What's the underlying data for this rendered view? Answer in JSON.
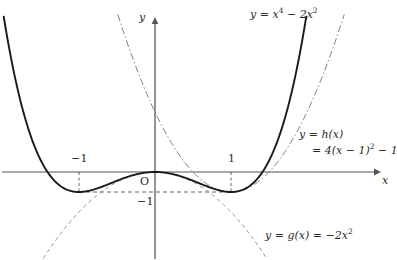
{
  "figure": {
    "title": "",
    "background_color": "#ffffff",
    "axis_color": "#555555",
    "curve_color": "#1a1a1a",
    "helper_color": "#6b6b6b",
    "text_color": "#2b2b2b"
  },
  "axes": {
    "x_axis_label": "x",
    "y_axis_label": "y",
    "origin_label": "O",
    "x_ticks": [
      {
        "value": -1,
        "label": "−1"
      },
      {
        "value": 1,
        "label": "1"
      }
    ],
    "y_ticks": [
      {
        "value": -1,
        "label": "−1"
      }
    ],
    "xlim": [
      -2.0,
      2.95
    ],
    "ylim": [
      -4.4,
      7.6
    ],
    "grid": false
  },
  "curves": [
    {
      "id": "quartic",
      "name": "f",
      "label_text": "y = x",
      "label_exp1": "4",
      "label_mid": " − 2x",
      "label_exp2": "2",
      "expression": "y = x^4 - 2x^2",
      "style": "solid",
      "color": "#1a1a1a",
      "width": 1.9,
      "minima": [
        {
          "x": -1,
          "y": -1
        },
        {
          "x": 1,
          "y": -1
        }
      ],
      "roots": [
        -1.41421,
        0,
        1.41421
      ]
    },
    {
      "id": "h",
      "name": "h",
      "label_line1": "y = h(x)",
      "label_line2_pre": "= 4(x − 1)",
      "label_line2_exp": "2",
      "label_line2_post": " − 1",
      "expression": "y = h(x) = 4(x-1)^2 - 1",
      "style": "dashdot",
      "color": "#7a7a7a",
      "width": 1.0,
      "vertex": {
        "x": 1,
        "y": -1
      },
      "y_intercept": 3
    },
    {
      "id": "g",
      "name": "g",
      "label_pre": "y = g(x) = −2x",
      "label_exp": "2",
      "expression": "y = g(x) = -2x^2",
      "style": "dashed",
      "color": "#8a8a8a",
      "width": 1.0,
      "vertex": {
        "x": 0,
        "y": 0
      }
    }
  ],
  "guides": [
    {
      "id": "hline-minus1",
      "type": "horizontal-dashed",
      "y": -1,
      "from_x": -1,
      "to_x": 1
    },
    {
      "id": "vline-left-min",
      "type": "vertical-dashed",
      "x": -1,
      "from_y": 0,
      "to_y": -1
    },
    {
      "id": "vline-right-min",
      "type": "vertical-dashed",
      "x": 1,
      "from_y": 0,
      "to_y": -1
    }
  ],
  "chart_data": {
    "type": "line",
    "title": "",
    "xlabel": "x",
    "ylabel": "y",
    "xlim": [
      -2.0,
      2.95
    ],
    "ylim": [
      -4.4,
      7.6
    ],
    "grid": false,
    "legend": "inline-annotations",
    "annotations": [
      {
        "text": "y = x⁴ − 2x²",
        "x": 1.55,
        "y": 7.2
      },
      {
        "text": "y = h(x) = 4(x − 1)² − 1",
        "x": 2.0,
        "y": 1.6
      },
      {
        "text": "y = g(x) = −2x²",
        "x": 1.65,
        "y": -3.3
      }
    ],
    "series": [
      {
        "name": "y = x^4 - 2x^2",
        "style": "solid",
        "x": [
          -1.8,
          -1.7,
          -1.6,
          -1.5,
          -1.4,
          -1.3,
          -1.2,
          -1.1,
          -1.0,
          -0.9,
          -0.8,
          -0.7,
          -0.6,
          -0.5,
          -0.4,
          -0.3,
          -0.2,
          -0.1,
          0.0,
          0.1,
          0.2,
          0.3,
          0.4,
          0.5,
          0.6,
          0.7,
          0.8,
          0.9,
          1.0,
          1.1,
          1.2,
          1.3,
          1.4,
          1.5,
          1.6,
          1.7,
          1.8
        ],
        "values": [
          4.0,
          2.56,
          1.43,
          0.56,
          -0.08,
          -0.52,
          -0.81,
          -0.96,
          -1.0,
          -0.96,
          -0.87,
          -0.74,
          -0.59,
          -0.44,
          -0.29,
          -0.17,
          -0.08,
          -0.02,
          0.0,
          -0.02,
          -0.08,
          -0.17,
          -0.29,
          -0.44,
          -0.59,
          -0.74,
          -0.87,
          -0.96,
          -1.0,
          -0.96,
          -0.81,
          -0.52,
          -0.08,
          0.56,
          1.43,
          2.56,
          4.0
        ]
      },
      {
        "name": "y = h(x) = 4(x-1)^2 - 1",
        "style": "dashdot",
        "x": [
          -0.4,
          -0.2,
          0.0,
          0.2,
          0.4,
          0.6,
          0.8,
          1.0,
          1.2,
          1.4,
          1.6,
          1.8,
          2.0,
          2.2,
          2.4
        ],
        "values": [
          6.84,
          4.76,
          3.0,
          1.56,
          0.44,
          -0.36,
          -0.84,
          -1.0,
          -0.84,
          -0.36,
          0.44,
          1.56,
          3.0,
          4.76,
          6.84
        ]
      },
      {
        "name": "y = g(x) = -2x^2",
        "style": "dashed",
        "x": [
          -1.5,
          -1.25,
          -1.0,
          -0.75,
          -0.5,
          -0.25,
          0.0,
          0.25,
          0.5,
          0.75,
          1.0,
          1.25,
          1.5
        ],
        "values": [
          -4.5,
          -3.13,
          -2.0,
          -1.13,
          -0.5,
          -0.13,
          0.0,
          -0.13,
          -0.5,
          -1.13,
          -2.0,
          -3.13,
          -4.5
        ]
      }
    ]
  }
}
